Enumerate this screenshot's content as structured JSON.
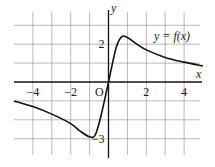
{
  "chart_data": {
    "type": "line",
    "title": "",
    "xlabel": "x",
    "ylabel": "y",
    "origin_label": "O",
    "curve_label": "y = f(x)",
    "x_ticks": [
      {
        "value": -4,
        "label": "−4"
      },
      {
        "value": -2,
        "label": "−2"
      },
      {
        "value": 2,
        "label": "2"
      },
      {
        "value": 4,
        "label": "4"
      }
    ],
    "y_ticks": [
      {
        "value": 2,
        "label": "2"
      },
      {
        "value": -3,
        "label": "−3"
      }
    ],
    "xlim": [
      -5,
      5
    ],
    "ylim": [
      -3.8,
      3.8
    ],
    "grid": true,
    "series": [
      {
        "name": "y = f(x)",
        "x": [
          -5,
          -4,
          -3,
          -2,
          -1.5,
          -1,
          -0.7,
          -0.4,
          0,
          0.4,
          0.7,
          1,
          1.5,
          2,
          3,
          4,
          5
        ],
        "y": [
          -1.0,
          -1.3,
          -1.7,
          -2.2,
          -2.6,
          -2.9,
          -2.8,
          -1.8,
          0,
          1.8,
          2.4,
          2.35,
          2.0,
          1.7,
          1.3,
          1.05,
          0.85
        ]
      }
    ]
  }
}
